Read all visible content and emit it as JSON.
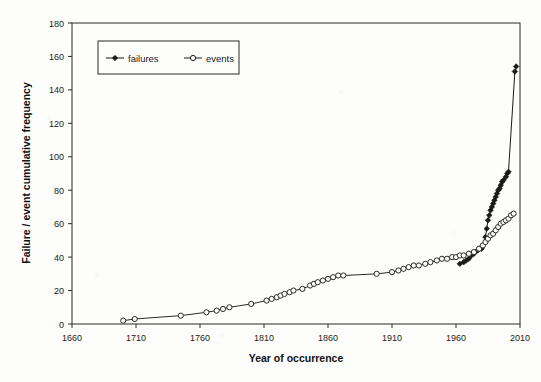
{
  "chart_data": {
    "type": "line",
    "title": "",
    "xlabel": "Year of occurrence",
    "ylabel": "Failure / event cumulative frequency",
    "xlim": [
      1660,
      2010
    ],
    "ylim": [
      0,
      180
    ],
    "xticks": [
      1660,
      1710,
      1760,
      1810,
      1860,
      1910,
      1960,
      2010
    ],
    "yticks": [
      0,
      20,
      40,
      60,
      80,
      100,
      120,
      140,
      160,
      180
    ],
    "grid": false,
    "legend_position": "top-left-inside",
    "series": [
      {
        "name": "failures",
        "marker": "filled-diamond",
        "color": "#1a1a1a",
        "points": [
          [
            1963,
            36
          ],
          [
            1966,
            37
          ],
          [
            1968,
            38
          ],
          [
            1970,
            39
          ],
          [
            1972,
            41
          ],
          [
            1974,
            42
          ],
          [
            1975,
            43
          ],
          [
            1977,
            44
          ],
          [
            1980,
            45
          ],
          [
            1981,
            47
          ],
          [
            1983,
            52
          ],
          [
            1984,
            57
          ],
          [
            1985,
            62
          ],
          [
            1986,
            65
          ],
          [
            1987,
            68
          ],
          [
            1988,
            70
          ],
          [
            1989,
            72
          ],
          [
            1990,
            74
          ],
          [
            1991,
            76
          ],
          [
            1992,
            78
          ],
          [
            1993,
            80
          ],
          [
            1994,
            81
          ],
          [
            1995,
            83
          ],
          [
            1996,
            85
          ],
          [
            1997,
            86
          ],
          [
            1999,
            88
          ],
          [
            2000,
            90
          ],
          [
            2001,
            91
          ],
          [
            2006,
            151
          ],
          [
            2007,
            154
          ]
        ]
      },
      {
        "name": "events",
        "marker": "open-circle",
        "color": "#2a2a2a",
        "points": [
          [
            1700,
            2
          ],
          [
            1709,
            3
          ],
          [
            1745,
            5
          ],
          [
            1765,
            7
          ],
          [
            1773,
            8
          ],
          [
            1778,
            9
          ],
          [
            1783,
            10
          ],
          [
            1800,
            12
          ],
          [
            1812,
            14
          ],
          [
            1816,
            15
          ],
          [
            1820,
            16
          ],
          [
            1823,
            17
          ],
          [
            1826,
            18
          ],
          [
            1830,
            19
          ],
          [
            1833,
            20
          ],
          [
            1840,
            21
          ],
          [
            1846,
            23
          ],
          [
            1849,
            24
          ],
          [
            1852,
            25
          ],
          [
            1856,
            26
          ],
          [
            1860,
            27
          ],
          [
            1864,
            28
          ],
          [
            1868,
            29
          ],
          [
            1872,
            29
          ],
          [
            1898,
            30
          ],
          [
            1910,
            31
          ],
          [
            1915,
            32
          ],
          [
            1919,
            33
          ],
          [
            1923,
            34
          ],
          [
            1927,
            35
          ],
          [
            1931,
            35
          ],
          [
            1936,
            36
          ],
          [
            1940,
            37
          ],
          [
            1945,
            38
          ],
          [
            1949,
            39
          ],
          [
            1953,
            39
          ],
          [
            1957,
            40
          ],
          [
            1960,
            40
          ],
          [
            1963,
            41
          ],
          [
            1966,
            41
          ],
          [
            1970,
            42
          ],
          [
            1974,
            43
          ],
          [
            1978,
            45
          ],
          [
            1981,
            47
          ],
          [
            1983,
            49
          ],
          [
            1985,
            51
          ],
          [
            1987,
            53
          ],
          [
            1989,
            54
          ],
          [
            1991,
            56
          ],
          [
            1993,
            58
          ],
          [
            1995,
            60
          ],
          [
            1997,
            61
          ],
          [
            1999,
            62
          ],
          [
            2001,
            63
          ],
          [
            2003,
            65
          ],
          [
            2005,
            66
          ]
        ]
      }
    ],
    "legend": [
      {
        "label": "failures",
        "marker": "filled-diamond"
      },
      {
        "label": "events",
        "marker": "open-circle"
      }
    ]
  },
  "colors": {
    "axis": "#2b2b2b",
    "background": "#fdfdfc",
    "failures": "#1a1a1a",
    "events": "#2a2a2a"
  }
}
